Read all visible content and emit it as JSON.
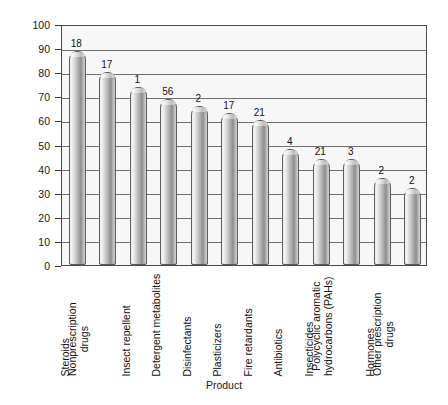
{
  "chart_data": {
    "type": "bar",
    "title": "",
    "xlabel": "Product",
    "ylabel": "Detection frequency (percent of samples)",
    "ylim": [
      0,
      100
    ],
    "ytick_step": 10,
    "ytick_labels": [
      "100",
      "90",
      "80",
      "70",
      "60",
      "50",
      "40",
      "30",
      "20",
      "10",
      "0"
    ],
    "grid": true,
    "legend": "none",
    "categories": [
      "Steroids",
      "Nonprescription drugs",
      "Insect repellent",
      "Detergent metabolites",
      "Disinfectants",
      "Plasticizers",
      "Fire retardants",
      "Antibiotics",
      "Insecticides",
      "Polycyclic aromatic hydrocarbons (PAHs)",
      "Hormones",
      "Other prescription drugs"
    ],
    "category_lines": [
      [
        "Steroids"
      ],
      [
        "Nonprescription",
        "drugs"
      ],
      [
        "Insect repellent"
      ],
      [
        "Detergent metabolites"
      ],
      [
        "Disinfectants"
      ],
      [
        "Plasticizers"
      ],
      [
        "Fire retardants"
      ],
      [
        "Antibiotics"
      ],
      [
        "Insecticides"
      ],
      [
        "Polycyclic aromatic",
        "hydrocarbons (PAHs)"
      ],
      [
        "Hormones"
      ],
      [
        "Other prescription",
        "drugs"
      ]
    ],
    "values": [
      89,
      80,
      74,
      69,
      66,
      63,
      60,
      48,
      44,
      44,
      36,
      32
    ],
    "bar_labels": [
      "18",
      "17",
      "1",
      "56",
      "2",
      "17",
      "21",
      "4",
      "21",
      "3",
      "2",
      "2"
    ]
  },
  "colors": {
    "plot_background": "#f7f7f7",
    "gridline": "#6f6f6f",
    "axis": "#4a4a4a",
    "bar_light": "#f4f4f4",
    "bar_dark": "#8e8e8e",
    "text": "#111111"
  }
}
